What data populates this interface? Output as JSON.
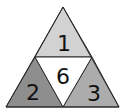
{
  "diagram": {
    "regions": [
      {
        "id": "top",
        "label": "1",
        "fill": "#d2d2d2"
      },
      {
        "id": "left",
        "label": "2",
        "fill": "#8e8e8e"
      },
      {
        "id": "right",
        "label": "3",
        "fill": "#acacac"
      },
      {
        "id": "center",
        "label": "6",
        "fill": "#ffffff"
      }
    ],
    "stroke": "#2a2a2a"
  }
}
